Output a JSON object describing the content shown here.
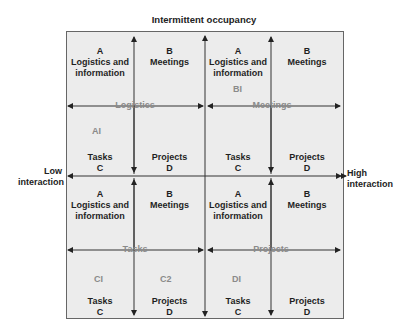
{
  "title": "Intermittent occupancy",
  "axis": {
    "low_line1": "Low",
    "low_line2": "interaction",
    "high_line1": "High",
    "high_line2": "interaction"
  },
  "quadrants": {
    "top_left": {
      "cells": {
        "a": {
          "letter": "A",
          "l1": "Logistics and",
          "l2": "information"
        },
        "b": {
          "letter": "B",
          "l1": "Meetings"
        },
        "c": {
          "l1": "Tasks",
          "letter": "C"
        },
        "d": {
          "l1": "Projects",
          "letter": "D"
        }
      },
      "arrow_label": "Logistics",
      "marker": "AI"
    },
    "top_right": {
      "cells": {
        "a": {
          "letter": "A",
          "l1": "Logistics and",
          "l2": "information"
        },
        "b": {
          "letter": "B",
          "l1": "Meetings"
        },
        "c": {
          "l1": "Tasks",
          "letter": "C"
        },
        "d": {
          "l1": "Projects",
          "letter": "D"
        }
      },
      "arrow_label": "Meetings",
      "marker": "BI"
    },
    "bottom_left": {
      "cells": {
        "a": {
          "letter": "A",
          "l1": "Logistics and",
          "l2": "information"
        },
        "b": {
          "letter": "B",
          "l1": "Meetings"
        },
        "c": {
          "l1": "Tasks",
          "letter": "C"
        },
        "d": {
          "l1": "Projects",
          "letter": "D"
        }
      },
      "arrow_label": "Tasks",
      "marker": "CI",
      "marker2": "C2"
    },
    "bottom_right": {
      "cells": {
        "a": {
          "letter": "A",
          "l1": "Logistics and",
          "l2": "information"
        },
        "b": {
          "letter": "B",
          "l1": "Meetings"
        },
        "c": {
          "l1": "Tasks",
          "letter": "C"
        },
        "d": {
          "l1": "Projects",
          "letter": "D"
        }
      },
      "arrow_label": "Projects",
      "marker": "DI"
    }
  },
  "colors": {
    "background": "#ececec",
    "line": "#333333",
    "faint_text": "#8a8a8a"
  }
}
